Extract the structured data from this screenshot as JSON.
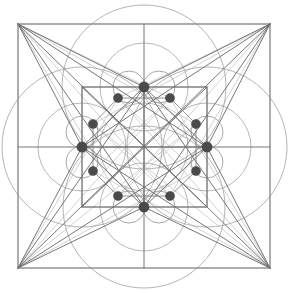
{
  "figure": {
    "type": "geometric-line-diagram",
    "canvas": {
      "width": 288,
      "height": 294,
      "background": "#ffffff"
    }
  },
  "colors": {
    "outer_square_stroke": "#8a8a8a",
    "inner_square_stroke": "#6e6e6e",
    "major_line_stroke": "#6b6b6b",
    "faint_line_stroke": "#c9c9c9",
    "circle_stroke": "#9b9b9b",
    "small_circle_stroke": "#8d8d8d",
    "node_fill": "#4a4a4a"
  },
  "geometry": {
    "center": {
      "x": 144,
      "y": 147
    },
    "outer_square": {
      "x": 18,
      "y": 24,
      "width": 252,
      "height": 244
    },
    "inner_square": {
      "x": 82,
      "y": 87,
      "width": 125,
      "height": 120
    },
    "outer_square_corners": [
      {
        "name": "top-left",
        "x": 18,
        "y": 24
      },
      {
        "name": "top-right",
        "x": 270,
        "y": 24
      },
      {
        "name": "bottom-right",
        "x": 270,
        "y": 268
      },
      {
        "name": "bottom-left",
        "x": 18,
        "y": 268
      }
    ],
    "large_circles": [
      {
        "name": "top-circle",
        "cx": 144,
        "cy": 87,
        "r": 82
      },
      {
        "name": "bottom-circle",
        "cx": 144,
        "cy": 207,
        "r": 81
      },
      {
        "name": "left-circle",
        "cx": 82,
        "cy": 147,
        "r": 80
      },
      {
        "name": "right-circle",
        "cx": 207,
        "cy": 147,
        "r": 80
      }
    ],
    "mid_circles": [
      {
        "name": "mid-top",
        "cx": 144,
        "cy": 87,
        "r": 44
      },
      {
        "name": "mid-bottom",
        "cx": 144,
        "cy": 207,
        "r": 44
      },
      {
        "name": "mid-left",
        "cx": 82,
        "cy": 147,
        "r": 44
      },
      {
        "name": "mid-right",
        "cx": 207,
        "cy": 147,
        "r": 44
      },
      {
        "name": "core",
        "cx": 144,
        "cy": 147,
        "r": 44
      }
    ],
    "small_circles": [
      {
        "name": "small-top-left",
        "cx": 129,
        "cy": 87,
        "r": 16
      },
      {
        "name": "small-top-right",
        "cx": 159,
        "cy": 87,
        "r": 16
      },
      {
        "name": "small-bottom-left",
        "cx": 129,
        "cy": 207,
        "r": 16
      },
      {
        "name": "small-bottom-right",
        "cx": 159,
        "cy": 207,
        "r": 16
      },
      {
        "name": "small-left-upper",
        "cx": 82,
        "cy": 132,
        "r": 16
      },
      {
        "name": "small-left-lower",
        "cx": 82,
        "cy": 162,
        "r": 16
      },
      {
        "name": "small-right-upper",
        "cx": 207,
        "cy": 132,
        "r": 16
      },
      {
        "name": "small-right-lower",
        "cx": 207,
        "cy": 162,
        "r": 16
      }
    ],
    "nodes": [
      {
        "name": "node-top",
        "x": 144,
        "y": 87,
        "r": 5.2
      },
      {
        "name": "node-bottom",
        "x": 144,
        "y": 207,
        "r": 5.2
      },
      {
        "name": "node-left",
        "x": 82,
        "y": 147,
        "r": 5.2
      },
      {
        "name": "node-right",
        "x": 207,
        "y": 147,
        "r": 5.2
      },
      {
        "name": "node-upper-left",
        "x": 118,
        "y": 98,
        "r": 4.6
      },
      {
        "name": "node-upper-right",
        "x": 170,
        "y": 98,
        "r": 4.6
      },
      {
        "name": "node-left-upper",
        "x": 93,
        "y": 124,
        "r": 4.6
      },
      {
        "name": "node-right-upper",
        "x": 196,
        "y": 124,
        "r": 4.6
      },
      {
        "name": "node-left-lower",
        "x": 93,
        "y": 171,
        "r": 4.6
      },
      {
        "name": "node-right-lower",
        "x": 196,
        "y": 171,
        "r": 4.6
      },
      {
        "name": "node-lower-left",
        "x": 118,
        "y": 196,
        "r": 4.6
      },
      {
        "name": "node-lower-right",
        "x": 170,
        "y": 196,
        "r": 4.6
      }
    ],
    "major_lines": [
      {
        "name": "axis-horizontal",
        "x1": 18,
        "y1": 147,
        "x2": 270,
        "y2": 147
      },
      {
        "name": "axis-vertical",
        "x1": 144,
        "y1": 24,
        "x2": 144,
        "y2": 268
      },
      {
        "name": "diagonal-tl-br",
        "x1": 18,
        "y1": 24,
        "x2": 270,
        "y2": 268
      },
      {
        "name": "diagonal-tr-bl",
        "x1": 270,
        "y1": 24,
        "x2": 18,
        "y2": 268
      },
      {
        "name": "fan-tl-to-top",
        "x1": 18,
        "y1": 24,
        "x2": 144,
        "y2": 87
      },
      {
        "name": "fan-tl-to-left",
        "x1": 18,
        "y1": 24,
        "x2": 82,
        "y2": 147
      },
      {
        "name": "fan-tl-to-right",
        "x1": 18,
        "y1": 24,
        "x2": 207,
        "y2": 147
      },
      {
        "name": "fan-tl-to-bottom",
        "x1": 18,
        "y1": 24,
        "x2": 144,
        "y2": 207
      },
      {
        "name": "fan-tr-to-top",
        "x1": 270,
        "y1": 24,
        "x2": 144,
        "y2": 87
      },
      {
        "name": "fan-tr-to-right",
        "x1": 270,
        "y1": 24,
        "x2": 207,
        "y2": 147
      },
      {
        "name": "fan-tr-to-left",
        "x1": 270,
        "y1": 24,
        "x2": 82,
        "y2": 147
      },
      {
        "name": "fan-tr-to-bottom",
        "x1": 270,
        "y1": 24,
        "x2": 144,
        "y2": 207
      },
      {
        "name": "fan-br-to-bottom",
        "x1": 270,
        "y1": 268,
        "x2": 144,
        "y2": 207
      },
      {
        "name": "fan-br-to-right",
        "x1": 270,
        "y1": 268,
        "x2": 207,
        "y2": 147
      },
      {
        "name": "fan-br-to-left",
        "x1": 270,
        "y1": 268,
        "x2": 82,
        "y2": 147
      },
      {
        "name": "fan-br-to-top",
        "x1": 270,
        "y1": 268,
        "x2": 144,
        "y2": 87
      },
      {
        "name": "fan-bl-to-bottom",
        "x1": 18,
        "y1": 268,
        "x2": 144,
        "y2": 207
      },
      {
        "name": "fan-bl-to-left",
        "x1": 18,
        "y1": 268,
        "x2": 82,
        "y2": 147
      },
      {
        "name": "fan-bl-to-right",
        "x1": 18,
        "y1": 268,
        "x2": 207,
        "y2": 147
      },
      {
        "name": "fan-bl-to-top",
        "x1": 18,
        "y1": 268,
        "x2": 144,
        "y2": 87
      },
      {
        "name": "inner-diamond-tl",
        "x1": 144,
        "y1": 87,
        "x2": 82,
        "y2": 147
      },
      {
        "name": "inner-diamond-tr",
        "x1": 144,
        "y1": 87,
        "x2": 207,
        "y2": 147
      },
      {
        "name": "inner-diamond-br",
        "x1": 207,
        "y1": 147,
        "x2": 144,
        "y2": 207
      },
      {
        "name": "inner-diamond-bl",
        "x1": 82,
        "y1": 147,
        "x2": 144,
        "y2": 207
      },
      {
        "name": "inner-square-diag-1",
        "x1": 82,
        "y1": 87,
        "x2": 207,
        "y2": 207
      },
      {
        "name": "inner-square-diag-2",
        "x1": 207,
        "y1": 87,
        "x2": 82,
        "y2": 207
      },
      {
        "name": "inner-mid-h",
        "x1": 82,
        "y1": 147,
        "x2": 207,
        "y2": 147
      },
      {
        "name": "inner-mid-v",
        "x1": 144,
        "y1": 87,
        "x2": 144,
        "y2": 207
      }
    ],
    "faint_lines": [
      {
        "name": "faint-tl-fan-a",
        "x1": 18,
        "y1": 24,
        "x2": 118,
        "y2": 196
      },
      {
        "name": "faint-tl-fan-b",
        "x1": 18,
        "y1": 24,
        "x2": 170,
        "y2": 98
      },
      {
        "name": "faint-tl-fan-c",
        "x1": 18,
        "y1": 24,
        "x2": 196,
        "y2": 124
      },
      {
        "name": "faint-tl-fan-d",
        "x1": 18,
        "y1": 24,
        "x2": 170,
        "y2": 196
      },
      {
        "name": "faint-tr-fan-a",
        "x1": 270,
        "y1": 24,
        "x2": 170,
        "y2": 196
      },
      {
        "name": "faint-tr-fan-b",
        "x1": 270,
        "y1": 24,
        "x2": 118,
        "y2": 98
      },
      {
        "name": "faint-tr-fan-c",
        "x1": 270,
        "y1": 24,
        "x2": 93,
        "y2": 124
      },
      {
        "name": "faint-tr-fan-d",
        "x1": 270,
        "y1": 24,
        "x2": 118,
        "y2": 196
      },
      {
        "name": "faint-br-fan-a",
        "x1": 270,
        "y1": 268,
        "x2": 118,
        "y2": 98
      },
      {
        "name": "faint-br-fan-b",
        "x1": 270,
        "y1": 268,
        "x2": 170,
        "y2": 98
      },
      {
        "name": "faint-br-fan-c",
        "x1": 270,
        "y1": 268,
        "x2": 93,
        "y2": 124
      },
      {
        "name": "faint-br-fan-d",
        "x1": 270,
        "y1": 268,
        "x2": 93,
        "y2": 171
      },
      {
        "name": "faint-bl-fan-a",
        "x1": 18,
        "y1": 268,
        "x2": 170,
        "y2": 98
      },
      {
        "name": "faint-bl-fan-b",
        "x1": 18,
        "y1": 268,
        "x2": 118,
        "y2": 98
      },
      {
        "name": "faint-bl-fan-c",
        "x1": 18,
        "y1": 268,
        "x2": 196,
        "y2": 124
      },
      {
        "name": "faint-bl-fan-d",
        "x1": 18,
        "y1": 268,
        "x2": 196,
        "y2": 171
      },
      {
        "name": "faint-ring-1",
        "x1": 118,
        "y1": 98,
        "x2": 196,
        "y2": 171
      },
      {
        "name": "faint-ring-2",
        "x1": 170,
        "y1": 98,
        "x2": 93,
        "y2": 171
      },
      {
        "name": "faint-ring-3",
        "x1": 93,
        "y1": 124,
        "x2": 170,
        "y2": 196
      },
      {
        "name": "faint-ring-4",
        "x1": 196,
        "y1": 124,
        "x2": 118,
        "y2": 196
      }
    ],
    "node_ring_lines": [
      {
        "name": "ring-edge-1",
        "x1": 118,
        "y1": 98,
        "x2": 170,
        "y2": 98
      },
      {
        "name": "ring-edge-2",
        "x1": 170,
        "y1": 98,
        "x2": 196,
        "y2": 124
      },
      {
        "name": "ring-edge-3",
        "x1": 196,
        "y1": 124,
        "x2": 196,
        "y2": 171
      },
      {
        "name": "ring-edge-4",
        "x1": 196,
        "y1": 171,
        "x2": 170,
        "y2": 196
      },
      {
        "name": "ring-edge-5",
        "x1": 170,
        "y1": 196,
        "x2": 118,
        "y2": 196
      },
      {
        "name": "ring-edge-6",
        "x1": 118,
        "y1": 196,
        "x2": 93,
        "y2": 171
      },
      {
        "name": "ring-edge-7",
        "x1": 93,
        "y1": 171,
        "x2": 93,
        "y2": 124
      },
      {
        "name": "ring-edge-8",
        "x1": 93,
        "y1": 124,
        "x2": 118,
        "y2": 98
      }
    ]
  }
}
